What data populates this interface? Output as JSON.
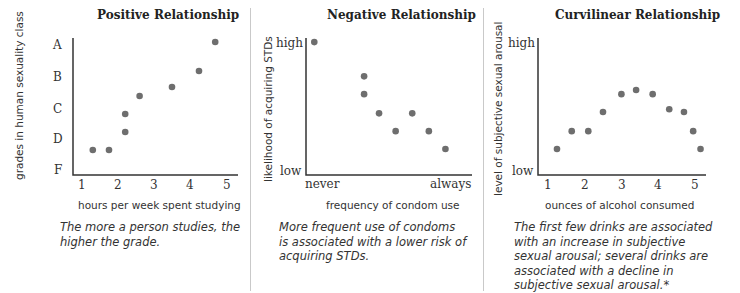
{
  "chart_data": [
    {
      "type": "scatter",
      "title": "Positive Relationship",
      "xlabel": "hours per week spent studying",
      "ylabel": "grades in human sexuality class",
      "x_ticks": [
        "1",
        "2",
        "3",
        "4",
        "5"
      ],
      "y_ticks": [
        "A",
        "B",
        "C",
        "D",
        "F"
      ],
      "points": [
        {
          "x": 1.3,
          "y": "D-"
        },
        {
          "x": 1.75,
          "y": "D-"
        },
        {
          "x": 2.2,
          "y": "D+"
        },
        {
          "x": 2.2,
          "y": "C-"
        },
        {
          "x": 2.6,
          "y": "C+"
        },
        {
          "x": 3.5,
          "y": "B-"
        },
        {
          "x": 4.25,
          "y": "B"
        },
        {
          "x": 4.7,
          "y": "A"
        }
      ],
      "caption": "The more a person studies, the higher the grade."
    },
    {
      "type": "scatter",
      "title": "Negative Relationship",
      "xlabel": "frequency of condom use",
      "ylabel": "likelihood of acquiring STDs",
      "x_ticks": [
        "never",
        "always"
      ],
      "y_ticks": [
        "high",
        "low"
      ],
      "points": [
        {
          "x": 0.05,
          "y": 0.97
        },
        {
          "x": 0.35,
          "y": 0.72
        },
        {
          "x": 0.35,
          "y": 0.59
        },
        {
          "x": 0.44,
          "y": 0.45
        },
        {
          "x": 0.54,
          "y": 0.32
        },
        {
          "x": 0.64,
          "y": 0.45
        },
        {
          "x": 0.74,
          "y": 0.32
        },
        {
          "x": 0.84,
          "y": 0.19
        }
      ],
      "caption": "More frequent use of condoms is associated with a lower risk of acquiring STDs."
    },
    {
      "type": "scatter",
      "title": "Curvilinear Relationship",
      "xlabel": "ounces of alcohol consumed",
      "ylabel": "level of subjective sexual arousal",
      "x_ticks": [
        "1",
        "2",
        "3",
        "4",
        "5"
      ],
      "y_ticks": [
        "high",
        "low"
      ],
      "points": [
        {
          "x": 1.25,
          "y": 0.19
        },
        {
          "x": 1.65,
          "y": 0.32
        },
        {
          "x": 2.1,
          "y": 0.32
        },
        {
          "x": 2.5,
          "y": 0.46
        },
        {
          "x": 3.0,
          "y": 0.59
        },
        {
          "x": 3.4,
          "y": 0.62
        },
        {
          "x": 3.85,
          "y": 0.59
        },
        {
          "x": 4.3,
          "y": 0.48
        },
        {
          "x": 4.7,
          "y": 0.46
        },
        {
          "x": 4.95,
          "y": 0.32
        },
        {
          "x": 5.15,
          "y": 0.19
        }
      ],
      "caption": "The first few drinks are associated with an increase in subjective sexual arousal; several drinks are associated with a decline in subjective sexual arousal.*"
    }
  ],
  "panels": [
    {
      "title": "Positive Relationship",
      "xlabel": "hours per week spent studying",
      "ylabel": "grades in human sexuality class",
      "yticks": [
        "A",
        "B",
        "C",
        "D",
        "F"
      ],
      "xticks": [
        "1",
        "2",
        "3",
        "4",
        "5"
      ],
      "caption_lines": [
        "The more a person studies, the",
        "higher the grade."
      ]
    },
    {
      "title": "Negative Relationship",
      "xlabel": "frequency of condom use",
      "ylabel": "likelihood of acquiring STDs",
      "yticks": [
        "high",
        "low"
      ],
      "xticks": [
        "never",
        "always"
      ],
      "caption_lines": [
        "More frequent use of condoms",
        "is associated with a lower risk of",
        "acquiring STDs."
      ]
    },
    {
      "title": "Curvilinear Relationship",
      "xlabel": "ounces of alcohol consumed",
      "ylabel": "level of subjective sexual arousal",
      "yticks": [
        "high",
        "low"
      ],
      "xticks": [
        "1",
        "2",
        "3",
        "4",
        "5"
      ],
      "caption_lines": [
        "The first few drinks are associated",
        "with an increase in subjective",
        "sexual arousal; several drinks are",
        "associated with a decline in",
        "subjective sexual arousal.*"
      ]
    }
  ],
  "colors": {
    "dot": "#6e6e6e",
    "axis": "#333333",
    "divider": "#c9c9c9"
  }
}
